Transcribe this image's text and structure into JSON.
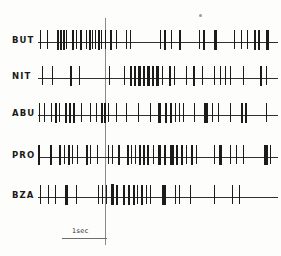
{
  "figure": {
    "type": "spike-raster",
    "title": "",
    "background_color": "#fdfdfc",
    "ink_color": "#1b1b1b",
    "baseline_color": "#303030",
    "stim_marker_color": "#8a8a8a",
    "speck_mark": "ink-speck"
  },
  "scalebar": {
    "label": "1sec",
    "left_px": 62,
    "width_px": 45,
    "seconds": 1
  },
  "stimulus_marker": {
    "x_px": 105,
    "top_px": 18,
    "bottom_px": 245,
    "label": ""
  },
  "axis": {
    "track_left_px": 38,
    "track_width_px": 240,
    "rows_top_px": [
      26,
      62,
      99,
      141,
      181
    ],
    "row_height_px": 34,
    "baseline_offset_px": 16
  },
  "chart_data": {
    "type": "scatter",
    "title": "",
    "xlabel": "time",
    "ylabel": "",
    "xlim": [
      0,
      240
    ],
    "ylim": [
      0,
      5
    ],
    "grid": false,
    "legend": "none",
    "annotations": [
      "1sec scale bar",
      "vertical stimulus marker at x=105"
    ],
    "categories": [
      "BUT",
      "NIT",
      "ABU",
      "PRO",
      "BZA"
    ],
    "series": [
      {
        "name": "BUT",
        "label": "BUT",
        "top_px": 26,
        "spikes": [
          {
            "x": 2,
            "w": 1,
            "h": 19
          },
          {
            "x": 9,
            "w": 1,
            "h": 19
          },
          {
            "x": 19,
            "w": 2,
            "h": 20
          },
          {
            "x": 22,
            "w": 2,
            "h": 20
          },
          {
            "x": 25,
            "w": 2,
            "h": 20
          },
          {
            "x": 28,
            "w": 1,
            "h": 19
          },
          {
            "x": 34,
            "w": 2,
            "h": 20
          },
          {
            "x": 38,
            "w": 1,
            "h": 19
          },
          {
            "x": 42,
            "w": 2,
            "h": 20
          },
          {
            "x": 48,
            "w": 1,
            "h": 19
          },
          {
            "x": 51,
            "w": 2,
            "h": 20
          },
          {
            "x": 54,
            "w": 1,
            "h": 19
          },
          {
            "x": 57,
            "w": 1,
            "h": 19
          },
          {
            "x": 60,
            "w": 2,
            "h": 20
          },
          {
            "x": 63,
            "w": 1,
            "h": 19
          },
          {
            "x": 67,
            "w": 1,
            "h": 19
          },
          {
            "x": 72,
            "w": 2,
            "h": 20
          },
          {
            "x": 78,
            "w": 1,
            "h": 19
          },
          {
            "x": 88,
            "w": 1,
            "h": 19
          },
          {
            "x": 92,
            "w": 1,
            "h": 19
          },
          {
            "x": 122,
            "w": 1,
            "h": 19
          },
          {
            "x": 126,
            "w": 2,
            "h": 20
          },
          {
            "x": 133,
            "w": 1,
            "h": 19
          },
          {
            "x": 141,
            "w": 2,
            "h": 20
          },
          {
            "x": 161,
            "w": 1,
            "h": 19
          },
          {
            "x": 165,
            "w": 2,
            "h": 20
          },
          {
            "x": 176,
            "w": 3,
            "h": 20
          },
          {
            "x": 196,
            "w": 1,
            "h": 19
          },
          {
            "x": 203,
            "w": 1,
            "h": 19
          },
          {
            "x": 209,
            "w": 1,
            "h": 19
          },
          {
            "x": 216,
            "w": 2,
            "h": 20
          },
          {
            "x": 220,
            "w": 2,
            "h": 20
          },
          {
            "x": 228,
            "w": 3,
            "h": 20
          }
        ]
      },
      {
        "name": "NIT",
        "label": "NIT",
        "top_px": 62,
        "spikes": [
          {
            "x": 4,
            "w": 1,
            "h": 19
          },
          {
            "x": 14,
            "w": 1,
            "h": 19
          },
          {
            "x": 32,
            "w": 2,
            "h": 20
          },
          {
            "x": 41,
            "w": 1,
            "h": 19
          },
          {
            "x": 71,
            "w": 1,
            "h": 19
          },
          {
            "x": 86,
            "w": 1,
            "h": 19
          },
          {
            "x": 92,
            "w": 2,
            "h": 20
          },
          {
            "x": 96,
            "w": 2,
            "h": 20
          },
          {
            "x": 100,
            "w": 3,
            "h": 20
          },
          {
            "x": 105,
            "w": 2,
            "h": 20
          },
          {
            "x": 109,
            "w": 3,
            "h": 20
          },
          {
            "x": 114,
            "w": 2,
            "h": 20
          },
          {
            "x": 118,
            "w": 3,
            "h": 20
          },
          {
            "x": 124,
            "w": 1,
            "h": 19
          },
          {
            "x": 131,
            "w": 2,
            "h": 20
          },
          {
            "x": 136,
            "w": 1,
            "h": 19
          },
          {
            "x": 148,
            "w": 1,
            "h": 19
          },
          {
            "x": 155,
            "w": 2,
            "h": 20
          },
          {
            "x": 164,
            "w": 1,
            "h": 19
          },
          {
            "x": 176,
            "w": 1,
            "h": 19
          },
          {
            "x": 182,
            "w": 1,
            "h": 19
          },
          {
            "x": 187,
            "w": 1,
            "h": 19
          },
          {
            "x": 192,
            "w": 1,
            "h": 19
          },
          {
            "x": 205,
            "w": 1,
            "h": 19
          },
          {
            "x": 222,
            "w": 2,
            "h": 20
          },
          {
            "x": 228,
            "w": 1,
            "h": 19
          }
        ]
      },
      {
        "name": "ABU",
        "label": "ABU",
        "top_px": 99,
        "spikes": [
          {
            "x": 1,
            "w": 1,
            "h": 19
          },
          {
            "x": 6,
            "w": 1,
            "h": 19
          },
          {
            "x": 13,
            "w": 1,
            "h": 19
          },
          {
            "x": 17,
            "w": 2,
            "h": 20
          },
          {
            "x": 21,
            "w": 1,
            "h": 19
          },
          {
            "x": 27,
            "w": 2,
            "h": 20
          },
          {
            "x": 31,
            "w": 2,
            "h": 20
          },
          {
            "x": 35,
            "w": 2,
            "h": 20
          },
          {
            "x": 43,
            "w": 1,
            "h": 19
          },
          {
            "x": 52,
            "w": 1,
            "h": 19
          },
          {
            "x": 58,
            "w": 1,
            "h": 19
          },
          {
            "x": 63,
            "w": 2,
            "h": 20
          },
          {
            "x": 66,
            "w": 2,
            "h": 20
          },
          {
            "x": 70,
            "w": 1,
            "h": 19
          },
          {
            "x": 78,
            "w": 1,
            "h": 19
          },
          {
            "x": 88,
            "w": 1,
            "h": 19
          },
          {
            "x": 100,
            "w": 1,
            "h": 19
          },
          {
            "x": 112,
            "w": 1,
            "h": 19
          },
          {
            "x": 120,
            "w": 3,
            "h": 20
          },
          {
            "x": 127,
            "w": 2,
            "h": 20
          },
          {
            "x": 132,
            "w": 2,
            "h": 20
          },
          {
            "x": 137,
            "w": 1,
            "h": 19
          },
          {
            "x": 141,
            "w": 1,
            "h": 19
          },
          {
            "x": 145,
            "w": 1,
            "h": 19
          },
          {
            "x": 156,
            "w": 1,
            "h": 19
          },
          {
            "x": 166,
            "w": 4,
            "h": 20
          },
          {
            "x": 174,
            "w": 1,
            "h": 19
          },
          {
            "x": 180,
            "w": 1,
            "h": 19
          },
          {
            "x": 192,
            "w": 1,
            "h": 19
          },
          {
            "x": 203,
            "w": 2,
            "h": 20
          },
          {
            "x": 207,
            "w": 2,
            "h": 20
          },
          {
            "x": 228,
            "w": 1,
            "h": 19
          }
        ]
      },
      {
        "name": "PRO",
        "label": "PRO",
        "top_px": 141,
        "spikes": [
          {
            "x": 0,
            "w": 2,
            "h": 20
          },
          {
            "x": 12,
            "w": 2,
            "h": 20
          },
          {
            "x": 21,
            "w": 2,
            "h": 20
          },
          {
            "x": 26,
            "w": 1,
            "h": 19
          },
          {
            "x": 30,
            "w": 2,
            "h": 20
          },
          {
            "x": 34,
            "w": 1,
            "h": 19
          },
          {
            "x": 39,
            "w": 1,
            "h": 19
          },
          {
            "x": 48,
            "w": 2,
            "h": 20
          },
          {
            "x": 52,
            "w": 1,
            "h": 19
          },
          {
            "x": 59,
            "w": 1,
            "h": 19
          },
          {
            "x": 70,
            "w": 1,
            "h": 19
          },
          {
            "x": 74,
            "w": 1,
            "h": 19
          },
          {
            "x": 80,
            "w": 2,
            "h": 20
          },
          {
            "x": 89,
            "w": 2,
            "h": 20
          },
          {
            "x": 93,
            "w": 1,
            "h": 19
          },
          {
            "x": 97,
            "w": 1,
            "h": 19
          },
          {
            "x": 101,
            "w": 2,
            "h": 20
          },
          {
            "x": 105,
            "w": 2,
            "h": 20
          },
          {
            "x": 109,
            "w": 2,
            "h": 20
          },
          {
            "x": 115,
            "w": 1,
            "h": 19
          },
          {
            "x": 120,
            "w": 3,
            "h": 20
          },
          {
            "x": 126,
            "w": 2,
            "h": 20
          },
          {
            "x": 132,
            "w": 4,
            "h": 20
          },
          {
            "x": 138,
            "w": 2,
            "h": 20
          },
          {
            "x": 143,
            "w": 2,
            "h": 20
          },
          {
            "x": 148,
            "w": 1,
            "h": 19
          },
          {
            "x": 153,
            "w": 2,
            "h": 20
          },
          {
            "x": 158,
            "w": 1,
            "h": 19
          },
          {
            "x": 176,
            "w": 1,
            "h": 19
          },
          {
            "x": 181,
            "w": 3,
            "h": 20
          },
          {
            "x": 192,
            "w": 1,
            "h": 19
          },
          {
            "x": 198,
            "w": 1,
            "h": 19
          },
          {
            "x": 205,
            "w": 1,
            "h": 19
          },
          {
            "x": 226,
            "w": 4,
            "h": 20
          },
          {
            "x": 232,
            "w": 1,
            "h": 19
          }
        ]
      },
      {
        "name": "BZA",
        "label": "BZA",
        "top_px": 181,
        "spikes": [
          {
            "x": 2,
            "w": 1,
            "h": 19
          },
          {
            "x": 10,
            "w": 1,
            "h": 19
          },
          {
            "x": 17,
            "w": 1,
            "h": 19
          },
          {
            "x": 27,
            "w": 3,
            "h": 20
          },
          {
            "x": 38,
            "w": 1,
            "h": 19
          },
          {
            "x": 60,
            "w": 1,
            "h": 19
          },
          {
            "x": 64,
            "w": 1,
            "h": 19
          },
          {
            "x": 68,
            "w": 1,
            "h": 19
          },
          {
            "x": 73,
            "w": 3,
            "h": 21
          },
          {
            "x": 78,
            "w": 2,
            "h": 20
          },
          {
            "x": 85,
            "w": 2,
            "h": 20
          },
          {
            "x": 90,
            "w": 2,
            "h": 20
          },
          {
            "x": 95,
            "w": 2,
            "h": 20
          },
          {
            "x": 99,
            "w": 1,
            "h": 19
          },
          {
            "x": 103,
            "w": 2,
            "h": 20
          },
          {
            "x": 108,
            "w": 1,
            "h": 19
          },
          {
            "x": 112,
            "w": 1,
            "h": 19
          },
          {
            "x": 124,
            "w": 4,
            "h": 20
          },
          {
            "x": 137,
            "w": 1,
            "h": 19
          },
          {
            "x": 141,
            "w": 1,
            "h": 19
          },
          {
            "x": 152,
            "w": 1,
            "h": 19
          },
          {
            "x": 176,
            "w": 1,
            "h": 19
          },
          {
            "x": 194,
            "w": 1,
            "h": 19
          },
          {
            "x": 201,
            "w": 1,
            "h": 19
          }
        ]
      }
    ]
  }
}
